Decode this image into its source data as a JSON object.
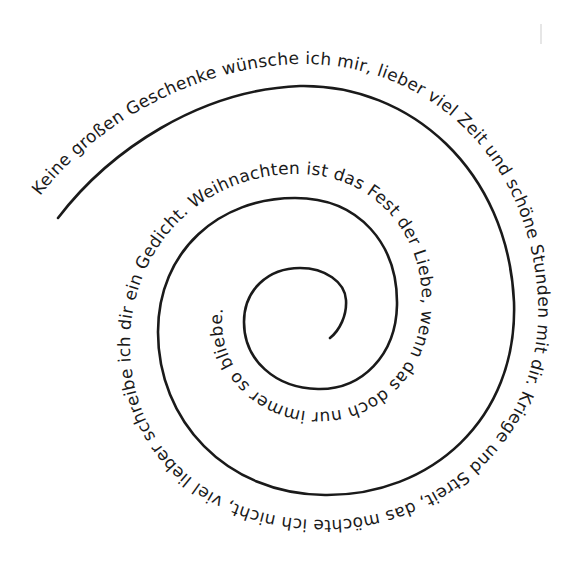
{
  "poem": {
    "full_text": "Keine großen Geschenke wünsche ich mir, lieber viel Zeit und schöne Stunden mit dir. Kriege und Streit, das möchte ich nicht, viel lieber schreibe ich dir ein Gedicht. Weihnachten ist das Fest der Liebe, wenn das doch nur immer so bliebe.",
    "segments": [
      {
        "id": "outer",
        "text": "Keine großen Geschenke wünsche ich mir, lieber viel Zeit und schöne Stunden mit dir. Kriege und Streit, das möchte ich nicht, viel lieber schreibe ich dir ein Gedicht. Weihnachten ist das Fest der Liebe, wenn das doch nur immer so bliebe."
      }
    ]
  },
  "style": {
    "ink_color": "#1a1a1a",
    "background": "#ffffff"
  }
}
